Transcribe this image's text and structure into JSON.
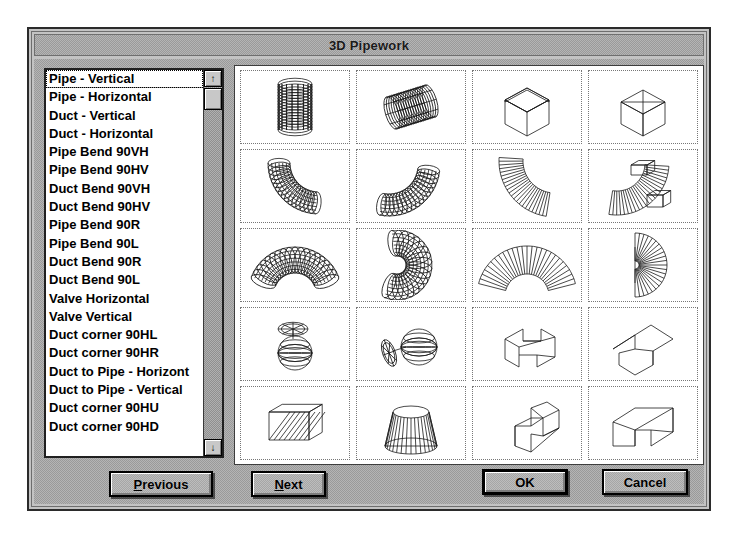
{
  "window": {
    "title": "3D Pipework"
  },
  "list": {
    "selected_index": 0,
    "items": [
      {
        "label": "Pipe - Vertical"
      },
      {
        "label": "Pipe - Horizontal"
      },
      {
        "label": "Duct - Vertical"
      },
      {
        "label": "Duct - Horizontal"
      },
      {
        "label": "Pipe Bend 90VH"
      },
      {
        "label": "Pipe Bend 90HV"
      },
      {
        "label": "Duct Bend 90VH"
      },
      {
        "label": "Duct Bend 90HV"
      },
      {
        "label": "Pipe Bend 90R"
      },
      {
        "label": "Pipe Bend 90L"
      },
      {
        "label": "Duct Bend 90R"
      },
      {
        "label": "Duct Bend 90L"
      },
      {
        "label": "Valve Horizontal"
      },
      {
        "label": "Valve Vertical"
      },
      {
        "label": "Duct corner 90HL"
      },
      {
        "label": "Duct corner 90HR"
      },
      {
        "label": "Duct to Pipe - Horizont"
      },
      {
        "label": "Duct to Pipe - Vertical"
      },
      {
        "label": "Duct corner 90HU"
      },
      {
        "label": "Duct corner 90HD"
      }
    ]
  },
  "scrollbar": {
    "up_arrow": "↑",
    "down_arrow": "↓"
  },
  "grid": {
    "columns": 4,
    "rows": 5,
    "cells": [
      {
        "name": "pipe-vertical",
        "icon": "pipe-vertical-thumb"
      },
      {
        "name": "pipe-horizontal",
        "icon": "pipe-horizontal-thumb"
      },
      {
        "name": "duct-vertical",
        "icon": "duct-vertical-thumb"
      },
      {
        "name": "duct-horizontal",
        "icon": "duct-horizontal-thumb"
      },
      {
        "name": "pipe-bend-90vh",
        "icon": "pipe-bend-90vh-thumb"
      },
      {
        "name": "pipe-bend-90hv",
        "icon": "pipe-bend-90hv-thumb"
      },
      {
        "name": "duct-bend-90vh",
        "icon": "duct-bend-90vh-thumb"
      },
      {
        "name": "duct-bend-90hv",
        "icon": "duct-bend-90hv-thumb"
      },
      {
        "name": "pipe-bend-90r",
        "icon": "pipe-bend-90r-thumb"
      },
      {
        "name": "pipe-bend-90l",
        "icon": "pipe-bend-90l-thumb"
      },
      {
        "name": "duct-bend-90r",
        "icon": "duct-bend-90r-thumb"
      },
      {
        "name": "duct-bend-90l",
        "icon": "duct-bend-90l-thumb"
      },
      {
        "name": "valve-horizontal",
        "icon": "valve-horizontal-thumb"
      },
      {
        "name": "valve-vertical",
        "icon": "valve-vertical-thumb"
      },
      {
        "name": "duct-corner-90hl",
        "icon": "duct-corner-90hl-thumb"
      },
      {
        "name": "duct-corner-90hr",
        "icon": "duct-corner-90hr-thumb"
      },
      {
        "name": "duct-to-pipe-horizontal",
        "icon": "duct-to-pipe-horizontal-thumb"
      },
      {
        "name": "duct-to-pipe-vertical",
        "icon": "duct-to-pipe-vertical-thumb"
      },
      {
        "name": "duct-corner-90hu",
        "icon": "duct-corner-90hu-thumb"
      },
      {
        "name": "duct-corner-90hd",
        "icon": "duct-corner-90hd-thumb"
      }
    ]
  },
  "buttons": {
    "previous": {
      "accel": "P",
      "rest": "revious"
    },
    "next": {
      "accel": "N",
      "rest": "ext"
    },
    "ok": {
      "label": "OK"
    },
    "cancel": {
      "label": "Cancel"
    }
  },
  "colors": {
    "face": "#c3c3c3",
    "window_bg": "#ffffff",
    "text": "#000000",
    "frame": "#2b2b2b"
  }
}
